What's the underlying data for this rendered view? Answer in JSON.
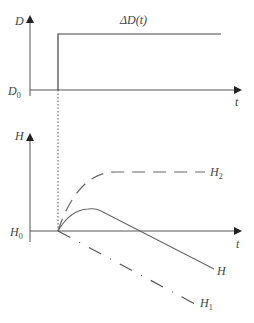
{
  "top_panel": {
    "y_axis_label": "D",
    "baseline_label": "D",
    "baseline_sub": "0",
    "x_axis_label": "t",
    "step_label": "ΔD(t)"
  },
  "bottom_panel": {
    "y_axis_label": "H",
    "baseline_label": "H",
    "baseline_sub": "0",
    "x_axis_label": "t",
    "curves": [
      {
        "name": "H2",
        "label": "H",
        "sub": "2",
        "style": "dashed"
      },
      {
        "name": "H",
        "label": "H",
        "sub": "",
        "style": "solid"
      },
      {
        "name": "H1",
        "label": "H",
        "sub": "1",
        "style": "dash-dot"
      }
    ]
  },
  "colors": {
    "axis": "#555555",
    "curve": "#666666",
    "text": "#444444"
  }
}
